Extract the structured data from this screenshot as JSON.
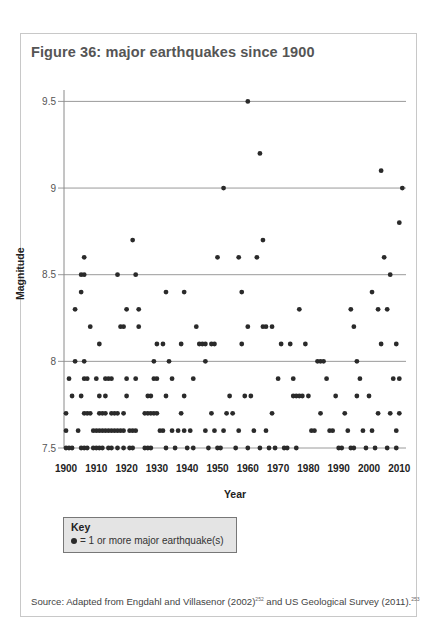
{
  "figure": {
    "title": "Figure 36: major earthquakes since 1900",
    "source_prefix": "Source: Adapted from Engdahl and Villasenor (2002)",
    "source_ref1": "252",
    "source_middle": " and US Geological Survey (2011).",
    "source_ref2": "253"
  },
  "key": {
    "title": "Key",
    "item": "= 1 or more major earthquake(s)"
  },
  "colors": {
    "dot": "#2a2a2a",
    "grid": "#9a9a9a",
    "frame": "#c8c8c8",
    "key_bg": "#e4e4e4"
  },
  "chart_data": {
    "type": "scatter",
    "title": "Figure 36: major earthquakes since 1900",
    "xlabel": "Year",
    "ylabel": "Magnitude",
    "xlim": [
      1900,
      2011
    ],
    "ylim": [
      7.5,
      9.5
    ],
    "x_ticks": [
      "1900",
      "1910",
      "1920",
      "1930",
      "1940",
      "1950",
      "1960",
      "1970",
      "1980",
      "1990",
      "2000",
      "2010"
    ],
    "y_ticks": [
      "7.5",
      "8",
      "8.5",
      "9",
      "9.5"
    ],
    "grid": "horizontal",
    "legend": "= 1 or more major earthquake(s)",
    "points": [
      [
        1900,
        7.5
      ],
      [
        1901,
        7.5
      ],
      [
        1902,
        7.5
      ],
      [
        1900,
        7.7
      ],
      [
        1900,
        7.6
      ],
      [
        1901,
        7.9
      ],
      [
        1902,
        7.8
      ],
      [
        1903,
        8.0
      ],
      [
        1903,
        8.3
      ],
      [
        1904,
        7.6
      ],
      [
        1905,
        8.4
      ],
      [
        1905,
        8.5
      ],
      [
        1906,
        8.5
      ],
      [
        1906,
        8.6
      ],
      [
        1906,
        8.0
      ],
      [
        1905,
        7.8
      ],
      [
        1906,
        7.7
      ],
      [
        1907,
        7.7
      ],
      [
        1908,
        7.7
      ],
      [
        1906,
        7.9
      ],
      [
        1907,
        7.9
      ],
      [
        1905,
        7.5
      ],
      [
        1906,
        7.5
      ],
      [
        1907,
        7.5
      ],
      [
        1908,
        8.2
      ],
      [
        1909,
        7.5
      ],
      [
        1910,
        7.5
      ],
      [
        1911,
        7.5
      ],
      [
        1912,
        7.5
      ],
      [
        1911,
        8.1
      ],
      [
        1910,
        7.9
      ],
      [
        1911,
        7.8
      ],
      [
        1913,
        7.8
      ],
      [
        1909,
        7.6
      ],
      [
        1910,
        7.6
      ],
      [
        1911,
        7.6
      ],
      [
        1912,
        7.6
      ],
      [
        1913,
        7.6
      ],
      [
        1914,
        7.6
      ],
      [
        1915,
        7.6
      ],
      [
        1916,
        7.6
      ],
      [
        1917,
        7.6
      ],
      [
        1918,
        7.6
      ],
      [
        1919,
        7.6
      ],
      [
        1911,
        7.7
      ],
      [
        1912,
        7.7
      ],
      [
        1913,
        7.7
      ],
      [
        1915,
        7.7
      ],
      [
        1916,
        7.7
      ],
      [
        1917,
        7.7
      ],
      [
        1919,
        7.7
      ],
      [
        1913,
        7.9
      ],
      [
        1914,
        7.9
      ],
      [
        1915,
        7.9
      ],
      [
        1914,
        7.5
      ],
      [
        1915,
        7.5
      ],
      [
        1917,
        7.5
      ],
      [
        1919,
        7.5
      ],
      [
        1917,
        8.5
      ],
      [
        1918,
        8.2
      ],
      [
        1919,
        8.2
      ],
      [
        1920,
        8.3
      ],
      [
        1920,
        7.8
      ],
      [
        1920,
        7.9
      ],
      [
        1921,
        7.6
      ],
      [
        1922,
        7.6
      ],
      [
        1923,
        7.6
      ],
      [
        1921,
        7.5
      ],
      [
        1922,
        7.5
      ],
      [
        1922,
        8.7
      ],
      [
        1923,
        8.5
      ],
      [
        1924,
        8.3
      ],
      [
        1924,
        8.2
      ],
      [
        1923,
        7.9
      ],
      [
        1926,
        7.5
      ],
      [
        1927,
        7.5
      ],
      [
        1928,
        7.5
      ],
      [
        1926,
        7.7
      ],
      [
        1927,
        7.7
      ],
      [
        1928,
        7.7
      ],
      [
        1929,
        7.7
      ],
      [
        1930,
        7.7
      ],
      [
        1927,
        7.8
      ],
      [
        1928,
        7.8
      ],
      [
        1929,
        8.0
      ],
      [
        1930,
        8.1
      ],
      [
        1929,
        7.9
      ],
      [
        1930,
        7.9
      ],
      [
        1931,
        7.6
      ],
      [
        1932,
        7.6
      ],
      [
        1933,
        7.5
      ],
      [
        1932,
        8.1
      ],
      [
        1933,
        8.4
      ],
      [
        1934,
        8.0
      ],
      [
        1935,
        7.9
      ],
      [
        1933,
        7.8
      ],
      [
        1936,
        7.5
      ],
      [
        1935,
        7.6
      ],
      [
        1937,
        7.6
      ],
      [
        1938,
        7.7
      ],
      [
        1939,
        7.8
      ],
      [
        1938,
        8.1
      ],
      [
        1939,
        8.4
      ],
      [
        1939,
        7.6
      ],
      [
        1940,
        7.5
      ],
      [
        1941,
        7.6
      ],
      [
        1942,
        7.5
      ],
      [
        1942,
        7.9
      ],
      [
        1943,
        8.2
      ],
      [
        1944,
        8.1
      ],
      [
        1945,
        8.1
      ],
      [
        1946,
        8.1
      ],
      [
        1946,
        7.6
      ],
      [
        1947,
        7.5
      ],
      [
        1948,
        8.1
      ],
      [
        1946,
        8.0
      ],
      [
        1948,
        7.7
      ],
      [
        1949,
        7.6
      ],
      [
        1949,
        8.1
      ],
      [
        1950,
        8.6
      ],
      [
        1950,
        7.5
      ],
      [
        1951,
        7.5
      ],
      [
        1952,
        9.0
      ],
      [
        1952,
        7.6
      ],
      [
        1953,
        7.7
      ],
      [
        1954,
        7.8
      ],
      [
        1955,
        7.7
      ],
      [
        1956,
        7.5
      ],
      [
        1957,
        8.6
      ],
      [
        1957,
        7.6
      ],
      [
        1958,
        8.4
      ],
      [
        1958,
        8.1
      ],
      [
        1959,
        7.8
      ],
      [
        1960,
        9.5
      ],
      [
        1960,
        8.2
      ],
      [
        1960,
        7.5
      ],
      [
        1961,
        7.8
      ],
      [
        1962,
        7.6
      ],
      [
        1963,
        8.6
      ],
      [
        1964,
        9.2
      ],
      [
        1965,
        8.7
      ],
      [
        1965,
        8.2
      ],
      [
        1966,
        8.2
      ],
      [
        1964,
        7.5
      ],
      [
        1966,
        7.6
      ],
      [
        1967,
        7.5
      ],
      [
        1968,
        8.2
      ],
      [
        1968,
        7.7
      ],
      [
        1969,
        7.5
      ],
      [
        1970,
        7.9
      ],
      [
        1971,
        8.1
      ],
      [
        1972,
        7.5
      ],
      [
        1973,
        7.5
      ],
      [
        1974,
        8.1
      ],
      [
        1975,
        7.9
      ],
      [
        1976,
        7.5
      ],
      [
        1977,
        8.3
      ],
      [
        1975,
        7.8
      ],
      [
        1976,
        7.8
      ],
      [
        1977,
        7.8
      ],
      [
        1978,
        7.8
      ],
      [
        1979,
        8.1
      ],
      [
        1980,
        7.8
      ],
      [
        1981,
        7.6
      ],
      [
        1982,
        7.6
      ],
      [
        1983,
        8.0
      ],
      [
        1984,
        8.0
      ],
      [
        1985,
        8.0
      ],
      [
        1984,
        7.7
      ],
      [
        1986,
        7.9
      ],
      [
        1987,
        7.6
      ],
      [
        1988,
        7.6
      ],
      [
        1989,
        7.8
      ],
      [
        1990,
        7.5
      ],
      [
        1991,
        7.5
      ],
      [
        1992,
        7.7
      ],
      [
        1993,
        7.6
      ],
      [
        1994,
        8.3
      ],
      [
        1995,
        8.2
      ],
      [
        1994,
        7.5
      ],
      [
        1995,
        7.5
      ],
      [
        1996,
        8.0
      ],
      [
        1996,
        7.8
      ],
      [
        1997,
        7.9
      ],
      [
        1998,
        7.6
      ],
      [
        1999,
        7.5
      ],
      [
        2000,
        7.8
      ],
      [
        2001,
        8.4
      ],
      [
        2001,
        7.6
      ],
      [
        2002,
        7.5
      ],
      [
        2003,
        8.3
      ],
      [
        2003,
        7.7
      ],
      [
        2004,
        9.1
      ],
      [
        2004,
        8.1
      ],
      [
        2005,
        8.6
      ],
      [
        2006,
        8.3
      ],
      [
        2006,
        7.5
      ],
      [
        2007,
        8.5
      ],
      [
        2007,
        7.7
      ],
      [
        2008,
        7.9
      ],
      [
        2009,
        8.1
      ],
      [
        2009,
        7.6
      ],
      [
        2010,
        8.8
      ],
      [
        2011,
        9.0
      ],
      [
        2010,
        7.9
      ],
      [
        2010,
        7.7
      ],
      [
        2009,
        7.5
      ]
    ]
  },
  "axis": {
    "y_title": "Magnitude",
    "x_title": "Year"
  }
}
